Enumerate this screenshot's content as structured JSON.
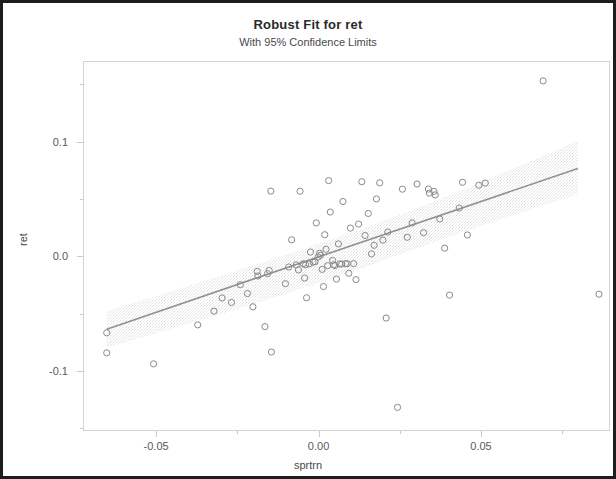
{
  "chart_data": {
    "type": "scatter",
    "title": "Robust Fit for ret",
    "subtitle": "With 95% Confidence Limits",
    "xlabel": "sprtrn",
    "ylabel": "ret",
    "xlim": [
      -0.0725,
      0.0897
    ],
    "ylim": [
      -0.1525,
      0.1705
    ],
    "xticks": [
      -0.05,
      0.0,
      0.05
    ],
    "xtick_labels": [
      "-0.05",
      "0.00",
      "0.05"
    ],
    "xminor_ticks": [
      -0.075,
      -0.025,
      0.025,
      0.075
    ],
    "yticks": [
      0.1,
      0.0,
      -0.1
    ],
    "ytick_labels": [
      "0.1",
      "0.0",
      "-0.1"
    ],
    "yminor_ticks": [
      0.15,
      0.05,
      -0.05,
      -0.15
    ],
    "grid": false,
    "legend": null,
    "marker": "open-circle",
    "marker_color": "#8a8a8a",
    "fit_line_color": "#8f8f94",
    "confidence_band_color": "#e2e2e2",
    "frame_color": "#d4d4d4",
    "fit_line": {
      "label": "Robust fit",
      "x": [
        -0.0655,
        0.0795
      ],
      "y": [
        -0.0627,
        0.0776
      ]
    },
    "confidence_band": {
      "label": "95% confidence limits",
      "x": [
        -0.0655,
        -0.05,
        -0.035,
        -0.02,
        -0.005,
        0.01,
        0.025,
        0.04,
        0.055,
        0.07,
        0.0795
      ],
      "upper": [
        -0.0468,
        -0.0335,
        -0.0202,
        -0.0067,
        0.0073,
        0.0219,
        0.0374,
        0.0541,
        0.0718,
        0.09,
        0.1018
      ],
      "lower": [
        -0.079,
        -0.066,
        -0.0534,
        -0.0405,
        -0.0268,
        -0.0124,
        0.0028,
        0.018,
        0.0325,
        0.0465,
        0.055
      ]
    },
    "points": [
      {
        "x": -0.0655,
        "y": -0.0659
      },
      {
        "x": -0.0655,
        "y": -0.0834
      },
      {
        "x": -0.0511,
        "y": -0.093
      },
      {
        "x": -0.0375,
        "y": -0.059
      },
      {
        "x": -0.0325,
        "y": -0.047
      },
      {
        "x": -0.03,
        "y": -0.0355
      },
      {
        "x": -0.0271,
        "y": -0.0394
      },
      {
        "x": -0.0244,
        "y": -0.0239
      },
      {
        "x": -0.0222,
        "y": -0.0316
      },
      {
        "x": -0.0205,
        "y": -0.0432
      },
      {
        "x": -0.0192,
        "y": -0.0124
      },
      {
        "x": -0.019,
        "y": -0.0163
      },
      {
        "x": -0.0168,
        "y": -0.0605
      },
      {
        "x": -0.016,
        "y": -0.0143
      },
      {
        "x": -0.0155,
        "y": -0.0115
      },
      {
        "x": -0.015,
        "y": 0.0578
      },
      {
        "x": -0.0148,
        "y": -0.0827
      },
      {
        "x": -0.0105,
        "y": -0.023
      },
      {
        "x": -0.0095,
        "y": -0.0085
      },
      {
        "x": -0.0086,
        "y": 0.0153
      },
      {
        "x": -0.0072,
        "y": -0.0066
      },
      {
        "x": -0.0065,
        "y": -0.011
      },
      {
        "x": -0.006,
        "y": 0.0577
      },
      {
        "x": -0.005,
        "y": -0.0056
      },
      {
        "x": -0.0046,
        "y": -0.0181
      },
      {
        "x": -0.0043,
        "y": -0.0066
      },
      {
        "x": -0.004,
        "y": -0.0353
      },
      {
        "x": -0.0032,
        "y": -0.0057
      },
      {
        "x": -0.0028,
        "y": 0.0046
      },
      {
        "x": -0.002,
        "y": -0.0042
      },
      {
        "x": -0.0014,
        "y": -0.0038
      },
      {
        "x": -0.001,
        "y": 0.03
      },
      {
        "x": -0.0004,
        "y": 0.0003
      },
      {
        "x": 0.0,
        "y": 0.0035
      },
      {
        "x": 0.0003,
        "y": 0.0018
      },
      {
        "x": 0.0008,
        "y": -0.0105
      },
      {
        "x": 0.0012,
        "y": -0.0255
      },
      {
        "x": 0.0016,
        "y": 0.0197
      },
      {
        "x": 0.002,
        "y": 0.007
      },
      {
        "x": 0.0025,
        "y": -0.0073
      },
      {
        "x": 0.0028,
        "y": 0.067
      },
      {
        "x": 0.0033,
        "y": 0.0395
      },
      {
        "x": 0.004,
        "y": -0.0027
      },
      {
        "x": 0.0043,
        "y": -0.0065
      },
      {
        "x": 0.0047,
        "y": -0.0073
      },
      {
        "x": 0.0052,
        "y": -0.019
      },
      {
        "x": 0.0058,
        "y": 0.0117
      },
      {
        "x": 0.0062,
        "y": -0.0058
      },
      {
        "x": 0.0068,
        "y": -0.0059
      },
      {
        "x": 0.0072,
        "y": 0.0487
      },
      {
        "x": 0.008,
        "y": -0.0055
      },
      {
        "x": 0.0085,
        "y": -0.0056
      },
      {
        "x": 0.009,
        "y": -0.014
      },
      {
        "x": 0.0095,
        "y": 0.0255
      },
      {
        "x": 0.0105,
        "y": -0.0055
      },
      {
        "x": 0.0112,
        "y": -0.0195
      },
      {
        "x": 0.012,
        "y": 0.029
      },
      {
        "x": 0.013,
        "y": 0.066
      },
      {
        "x": 0.014,
        "y": 0.019
      },
      {
        "x": 0.015,
        "y": 0.0383
      },
      {
        "x": 0.016,
        "y": 0.003
      },
      {
        "x": 0.0168,
        "y": 0.0105
      },
      {
        "x": 0.0175,
        "y": 0.051
      },
      {
        "x": 0.0185,
        "y": 0.065
      },
      {
        "x": 0.0195,
        "y": 0.015
      },
      {
        "x": 0.0205,
        "y": -0.053
      },
      {
        "x": 0.021,
        "y": 0.022
      },
      {
        "x": 0.024,
        "y": -0.131
      },
      {
        "x": 0.0255,
        "y": 0.0595
      },
      {
        "x": 0.027,
        "y": 0.0175
      },
      {
        "x": 0.0285,
        "y": 0.03
      },
      {
        "x": 0.03,
        "y": 0.064
      },
      {
        "x": 0.032,
        "y": 0.0215
      },
      {
        "x": 0.0335,
        "y": 0.0596
      },
      {
        "x": 0.0338,
        "y": 0.056
      },
      {
        "x": 0.0352,
        "y": 0.0575
      },
      {
        "x": 0.0356,
        "y": 0.0545
      },
      {
        "x": 0.037,
        "y": 0.0335
      },
      {
        "x": 0.0385,
        "y": 0.008
      },
      {
        "x": 0.04,
        "y": -0.033
      },
      {
        "x": 0.043,
        "y": 0.043
      },
      {
        "x": 0.044,
        "y": 0.0655
      },
      {
        "x": 0.0455,
        "y": 0.0195
      },
      {
        "x": 0.049,
        "y": 0.063
      },
      {
        "x": 0.051,
        "y": 0.0648
      },
      {
        "x": 0.0688,
        "y": 0.154
      },
      {
        "x": 0.086,
        "y": -0.0322
      }
    ]
  }
}
